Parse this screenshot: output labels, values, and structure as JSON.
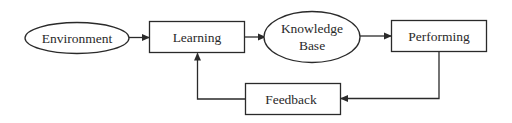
{
  "diagram": {
    "nodes": {
      "environment": {
        "label": "Environment",
        "shape": "ellipse"
      },
      "learning": {
        "label": "Learning",
        "shape": "rectangle"
      },
      "knowledge_base": {
        "label_line1": "Knowledge",
        "label_line2": "Base",
        "shape": "ellipse"
      },
      "performing": {
        "label": "Performing",
        "shape": "rectangle"
      },
      "feedback": {
        "label": "Feedback",
        "shape": "rectangle"
      }
    },
    "edges": [
      {
        "from": "Environment",
        "to": "Learning"
      },
      {
        "from": "Learning",
        "to": "Knowledge Base"
      },
      {
        "from": "Knowledge Base",
        "to": "Performing"
      },
      {
        "from": "Performing",
        "to": "Feedback"
      },
      {
        "from": "Feedback",
        "to": "Learning"
      }
    ],
    "stroke_color": "#2a2a2a"
  }
}
